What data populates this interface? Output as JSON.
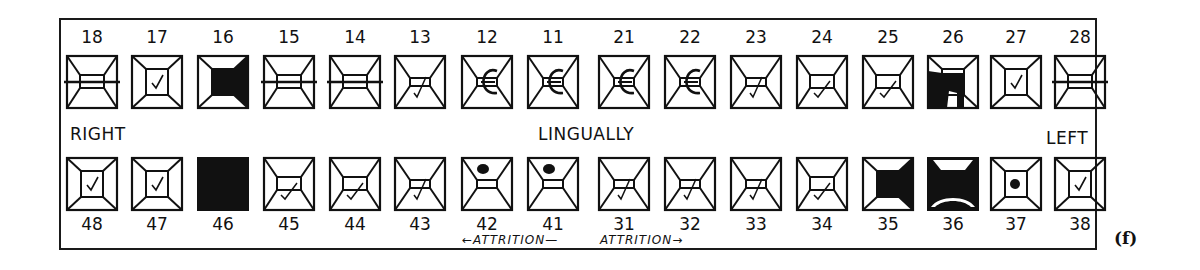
{
  "chart": {
    "figure_label": "(f)",
    "labels": {
      "right": "RIGHT",
      "left": "LEFT",
      "center": "LINGUALLY"
    },
    "annotation": {
      "left_arrow": "←ATTRITION—",
      "right_arrow": "ATTRITION→"
    },
    "upper_row": [
      {
        "number": "18",
        "state": "horizontal-line"
      },
      {
        "number": "17",
        "state": "check-occlusal"
      },
      {
        "number": "16",
        "state": "filled-occlusal-distal"
      },
      {
        "number": "15",
        "state": "horizontal-line"
      },
      {
        "number": "14",
        "state": "horizontal-line"
      },
      {
        "number": "13",
        "state": "check-incisal"
      },
      {
        "number": "12",
        "state": "crown-c"
      },
      {
        "number": "11",
        "state": "crown-c"
      },
      {
        "number": "21",
        "state": "crown-c"
      },
      {
        "number": "22",
        "state": "crown-c"
      },
      {
        "number": "23",
        "state": "check-incisal"
      },
      {
        "number": "24",
        "state": "check-occlusal-low"
      },
      {
        "number": "25",
        "state": "check-occlusal-low"
      },
      {
        "number": "26",
        "state": "filled-mesial-occlusal"
      },
      {
        "number": "27",
        "state": "check-occlusal"
      },
      {
        "number": "28",
        "state": "horizontal-line"
      }
    ],
    "lower_row": [
      {
        "number": "48",
        "state": "check-occlusal"
      },
      {
        "number": "47",
        "state": "check-occlusal"
      },
      {
        "number": "46",
        "state": "missing-filled"
      },
      {
        "number": "45",
        "state": "check-occlusal-low"
      },
      {
        "number": "44",
        "state": "check-occlusal-low"
      },
      {
        "number": "43",
        "state": "check-incisal"
      },
      {
        "number": "42",
        "state": "dot-labial"
      },
      {
        "number": "41",
        "state": "dot-labial"
      },
      {
        "number": "31",
        "state": "check-incisal"
      },
      {
        "number": "32",
        "state": "check-incisal"
      },
      {
        "number": "33",
        "state": "check-incisal"
      },
      {
        "number": "34",
        "state": "check-occlusal-low"
      },
      {
        "number": "35",
        "state": "filled-occlusal-distal"
      },
      {
        "number": "36",
        "state": "filled-full-crown"
      },
      {
        "number": "37",
        "state": "dot-occlusal"
      },
      {
        "number": "38",
        "state": "check-occlusal"
      }
    ],
    "colors": {
      "ink": "#111111",
      "paper": "#ffffff"
    }
  }
}
